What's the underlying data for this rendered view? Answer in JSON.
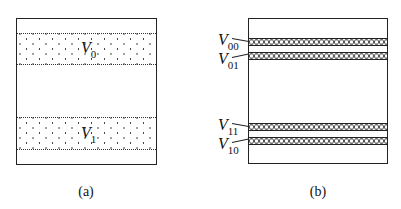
{
  "panel_a": {
    "caption": "(a)",
    "bands": [
      {
        "label": "V",
        "subscript": "0",
        "pattern": "dots"
      },
      {
        "label": "V",
        "subscript": "1",
        "pattern": "dots"
      }
    ]
  },
  "panel_b": {
    "caption": "(b)",
    "bands": [
      {
        "label": "V",
        "subscript": "00",
        "pattern": "chain"
      },
      {
        "label": "V",
        "subscript": "01",
        "pattern": "chain"
      },
      {
        "label": "V",
        "subscript": "11",
        "pattern": "chain"
      },
      {
        "label": "V",
        "subscript": "10",
        "pattern": "chain"
      }
    ]
  },
  "colors": {
    "line": "#222222",
    "background": "#ffffff"
  }
}
